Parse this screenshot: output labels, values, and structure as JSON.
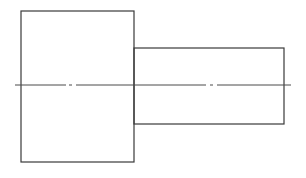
{
  "drawing": {
    "type": "stepped-shaft-side-view",
    "colors": {
      "outline": "#3a3a3a",
      "centerline": "#4a4a4a",
      "background": "#ffffff"
    },
    "shapes": [
      {
        "name": "large-cylinder-body",
        "x": 21,
        "y": 11,
        "width": 113,
        "height": 151
      },
      {
        "name": "small-cylinder-shaft",
        "x": 134,
        "y": 48,
        "width": 150,
        "height": 76
      }
    ],
    "centerline": {
      "y": 85,
      "x_start": 15,
      "x_end": 291,
      "segments": [
        [
          15,
          66
        ],
        [
          69,
          72
        ],
        [
          76,
          206
        ],
        [
          210,
          213
        ],
        [
          217,
          291
        ]
      ]
    }
  }
}
